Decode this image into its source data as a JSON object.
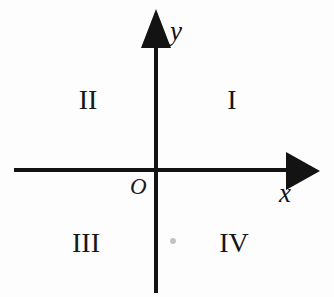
{
  "diagram": {
    "background_color": "#fdfdfd",
    "line_color": "#131313",
    "origin_label": "O",
    "axes": [
      {
        "name": "x-axis",
        "label": "x",
        "arrow_direction": "right"
      },
      {
        "name": "y-axis",
        "label": "y",
        "arrow_direction": "up"
      }
    ],
    "axis_labels": {
      "x": "x",
      "y": "y"
    },
    "quadrants": [
      {
        "id": "I",
        "label": "I",
        "position": "upper-right"
      },
      {
        "id": "II",
        "label": "II",
        "position": "upper-left"
      },
      {
        "id": "III",
        "label": "III",
        "position": "lower-left"
      },
      {
        "id": "IV",
        "label": "IV",
        "position": "lower-right"
      }
    ],
    "artifact": {
      "name": "scan-speck",
      "color": "#b9b9b9"
    }
  },
  "chart_data": {
    "type": "diagram",
    "xlabel": "x",
    "ylabel": "y",
    "origin": "O",
    "grid": false,
    "legend": "none",
    "annotations": [
      "I",
      "II",
      "III",
      "IV",
      "O",
      "x",
      "y"
    ],
    "quadrant_order": [
      "I",
      "II",
      "III",
      "IV"
    ]
  }
}
